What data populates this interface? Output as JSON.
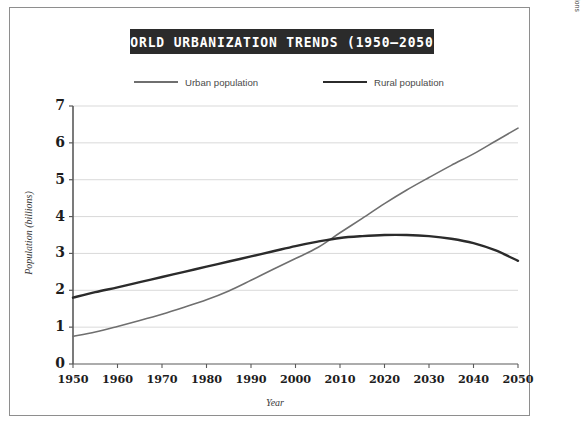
{
  "figure": {
    "title": "WORLD URBANIZATION TRENDS (1950–2050)",
    "source_note": "Source: Department of Economic and Social Affairs of the United Nations",
    "frame_color": "#8e8e8e",
    "title_bar_color": "#2b2b2b",
    "title_text_color": "#ffffff",
    "background_color": "#ffffff"
  },
  "chart_data": {
    "type": "line",
    "title": "WORLD URBANIZATION TRENDS (1950–2050)",
    "xlabel": "Year",
    "ylabel": "Population (billions)",
    "xlim": [
      1950,
      2050
    ],
    "ylim": [
      0,
      7
    ],
    "grid": "horizontal",
    "legend_position": "top",
    "x_ticks": [
      1950,
      1960,
      1970,
      1980,
      1990,
      2000,
      2010,
      2020,
      2030,
      2040,
      2050
    ],
    "x_tick_labels": [
      "1950",
      "1960",
      "1970",
      "1980",
      "1990",
      "2000",
      "2010",
      "2020",
      "2030",
      "2040",
      "2050"
    ],
    "y_ticks": [
      0,
      1,
      2,
      3,
      4,
      5,
      6,
      7
    ],
    "y_tick_labels": [
      "0",
      "1",
      "2",
      "3",
      "4",
      "5",
      "6",
      "7"
    ],
    "x": [
      1950,
      1955,
      1960,
      1965,
      1970,
      1975,
      1980,
      1985,
      1990,
      1995,
      2000,
      2005,
      2010,
      2015,
      2020,
      2025,
      2030,
      2035,
      2040,
      2045,
      2050
    ],
    "series": [
      {
        "name": "Urban population",
        "color": "#6f6f6f",
        "line_width": 1.6,
        "values": [
          0.75,
          0.87,
          1.02,
          1.18,
          1.35,
          1.54,
          1.74,
          1.98,
          2.27,
          2.57,
          2.86,
          3.16,
          3.56,
          3.95,
          4.35,
          4.72,
          5.06,
          5.39,
          5.7,
          6.05,
          6.4
        ]
      },
      {
        "name": "Rural population",
        "color": "#2b2b2b",
        "line_width": 2.4,
        "values": [
          1.8,
          1.95,
          2.08,
          2.22,
          2.36,
          2.5,
          2.64,
          2.78,
          2.92,
          3.06,
          3.2,
          3.32,
          3.42,
          3.47,
          3.5,
          3.5,
          3.47,
          3.4,
          3.28,
          3.08,
          2.8
        ]
      }
    ],
    "annotations": [
      {
        "label": "crossover",
        "x": 2007,
        "y": 3.4
      }
    ]
  },
  "legend": {
    "entries": [
      {
        "label": "Urban population",
        "color": "#6f6f6f"
      },
      {
        "label": "Rural population",
        "color": "#2b2b2b"
      }
    ]
  }
}
